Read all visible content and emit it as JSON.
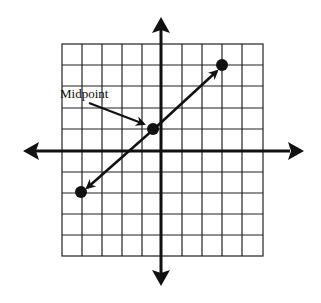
{
  "diagram": {
    "type": "coordinate-plane-midpoint",
    "grid": {
      "columns": 10,
      "rows": 10,
      "x_min": -5,
      "x_max": 5,
      "y_min": -5,
      "y_max": 5
    },
    "axes": {
      "x_axis_arrows": true,
      "y_axis_arrows": true
    },
    "segment": {
      "endpoint_a": {
        "x": 3,
        "y": 4
      },
      "endpoint_b": {
        "x": -4,
        "y": -2
      },
      "midpoint": {
        "x": -0.5,
        "y": 1
      },
      "arrowheads_at_endpoints": true
    },
    "label": {
      "text": "Midpoint",
      "points_to": "midpoint"
    },
    "colors": {
      "line": "#111111",
      "background": "#ffffff"
    }
  }
}
